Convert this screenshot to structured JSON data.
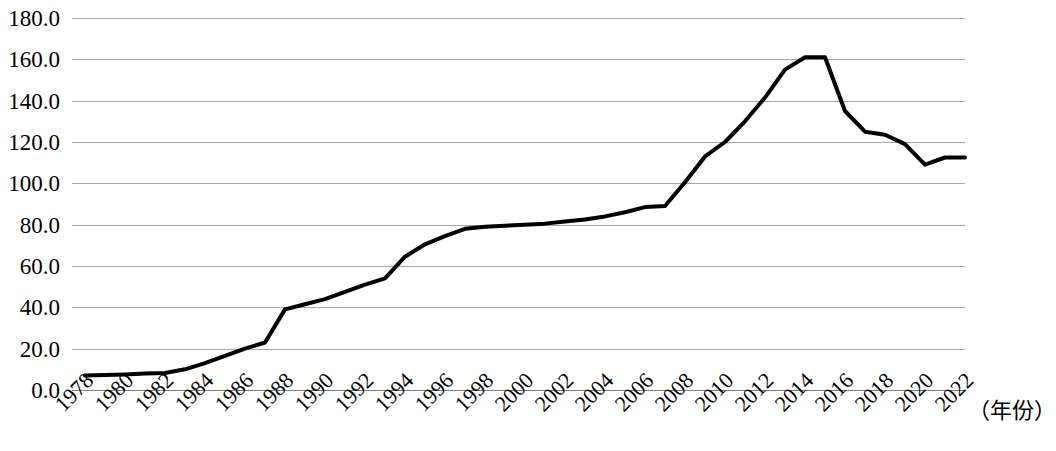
{
  "chart_data": {
    "type": "line",
    "title": "",
    "subtitle": "",
    "xlabel": "（年份）",
    "ylabel": "",
    "xlim": [
      1978,
      2022
    ],
    "ylim": [
      0,
      180
    ],
    "grid": true,
    "legend": "none",
    "line_color": "#000000",
    "grid_color": "#a6a6a6",
    "y_ticks": [
      "0.0",
      "20.0",
      "40.0",
      "60.0",
      "80.0",
      "100.0",
      "120.0",
      "140.0",
      "160.0",
      "180.0"
    ],
    "y_tick_values": [
      0,
      20,
      40,
      60,
      80,
      100,
      120,
      140,
      160,
      180
    ],
    "x_ticks": [
      "1978",
      "1980",
      "1982",
      "1984",
      "1986",
      "1988",
      "1990",
      "1992",
      "1994",
      "1996",
      "1998",
      "2000",
      "2002",
      "2004",
      "2006",
      "2008",
      "2010",
      "2012",
      "2014",
      "2016",
      "2018",
      "2020",
      "2022"
    ],
    "x": [
      1978,
      1979,
      1980,
      1981,
      1982,
      1983,
      1984,
      1985,
      1986,
      1987,
      1988,
      1989,
      1990,
      1991,
      1992,
      1993,
      1994,
      1995,
      1996,
      1997,
      1998,
      1999,
      2000,
      2001,
      2002,
      2003,
      2004,
      2005,
      2006,
      2007,
      2008,
      2009,
      2010,
      2011,
      2012,
      2013,
      2014,
      2015,
      2016,
      2017,
      2018,
      2019,
      2020,
      2021,
      2022
    ],
    "values": [
      7.0,
      7.2,
      7.5,
      8.0,
      8.2,
      10.0,
      13.0,
      16.5,
      20.0,
      23.0,
      39.0,
      41.5,
      44.0,
      47.5,
      51.0,
      54.0,
      64.5,
      70.5,
      74.5,
      78.0,
      79.0,
      79.5,
      80.0,
      80.5,
      81.5,
      82.5,
      84.0,
      86.0,
      88.5,
      89.0,
      100.5,
      113.0,
      120.0,
      130.0,
      141.5,
      155.0,
      161.0,
      161.0,
      135.0,
      125.0,
      123.5,
      119.0,
      109.0,
      112.5,
      112.5
    ]
  },
  "axis_title": "（年份）"
}
